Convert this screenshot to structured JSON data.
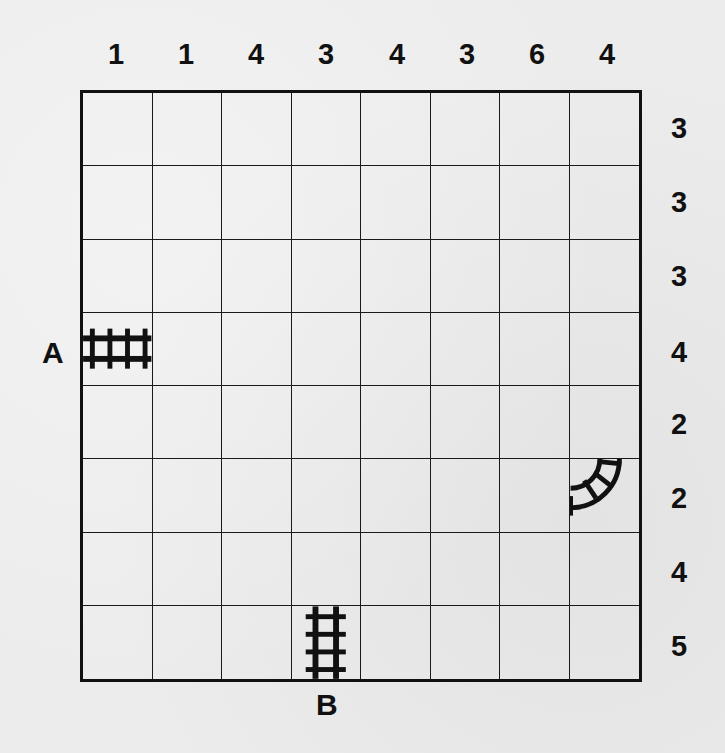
{
  "puzzle": {
    "type": "train-tracks",
    "size": {
      "cols": 8,
      "rows": 8
    },
    "column_clues": [
      "1",
      "1",
      "4",
      "3",
      "4",
      "3",
      "6",
      "4"
    ],
    "row_clues": [
      "3",
      "3",
      "3",
      "4",
      "2",
      "2",
      "4",
      "5"
    ],
    "endpoints": {
      "start": {
        "label": "A",
        "row": 4,
        "col": 1,
        "side": "left"
      },
      "end": {
        "label": "B",
        "row": 8,
        "col": 4,
        "side": "bottom"
      }
    },
    "given_tracks": [
      {
        "row": 4,
        "col": 1,
        "shape": "horizontal",
        "icon": "straight-track-horizontal"
      },
      {
        "row": 6,
        "col": 8,
        "shape": "curve-west-north",
        "icon": "curved-track"
      },
      {
        "row": 8,
        "col": 4,
        "shape": "vertical",
        "icon": "straight-track-vertical"
      }
    ]
  }
}
